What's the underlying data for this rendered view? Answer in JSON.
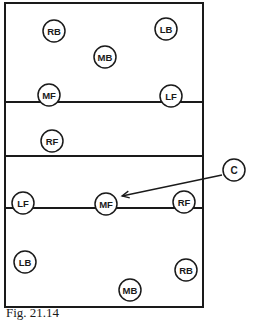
{
  "figure": {
    "caption": "Fig. 21.14",
    "court": {
      "left": 5,
      "top": 3,
      "right": 203,
      "bottom": 307,
      "lines_y": [
        102,
        156,
        208
      ]
    },
    "players": [
      {
        "label": "RB",
        "x": 54,
        "y": 31,
        "side": "top"
      },
      {
        "label": "LB",
        "x": 166,
        "y": 29,
        "side": "top"
      },
      {
        "label": "MB",
        "x": 105,
        "y": 57,
        "side": "top"
      },
      {
        "label": "MF",
        "x": 49,
        "y": 95,
        "side": "top"
      },
      {
        "label": "LF",
        "x": 171,
        "y": 96,
        "side": "top"
      },
      {
        "label": "RF",
        "x": 52,
        "y": 141,
        "side": "middle"
      },
      {
        "label": "LF",
        "x": 23,
        "y": 203,
        "side": "bottom"
      },
      {
        "label": "MF",
        "x": 106,
        "y": 204,
        "side": "bottom"
      },
      {
        "label": "RF",
        "x": 184,
        "y": 202,
        "side": "bottom"
      },
      {
        "label": "LB",
        "x": 25,
        "y": 262,
        "side": "bottom"
      },
      {
        "label": "RB",
        "x": 186,
        "y": 270,
        "side": "bottom"
      },
      {
        "label": "MB",
        "x": 130,
        "y": 290,
        "side": "bottom"
      }
    ],
    "callout": {
      "label": "C",
      "x": 234,
      "y": 170,
      "arrow_from": [
        222,
        175
      ],
      "arrow_to": [
        122,
        196
      ]
    },
    "colors": {
      "line": "#1a1a1a",
      "background": "#ffffff"
    }
  }
}
